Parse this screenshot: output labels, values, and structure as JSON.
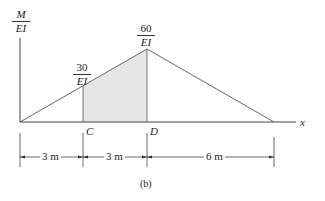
{
  "diagram": {
    "caption": "(b)",
    "y_axis_label": {
      "numerator": "M",
      "denominator": "EI"
    },
    "x_axis_label": "x",
    "peak_label": {
      "numerator": "60",
      "denominator": "EI"
    },
    "point_label": {
      "numerator": "30",
      "denominator": "EI"
    },
    "points": [
      {
        "name": "C",
        "label": "C"
      },
      {
        "name": "D",
        "label": "D"
      }
    ],
    "dimensions": [
      {
        "label": "3 m"
      },
      {
        "label": "3 m"
      },
      {
        "label": "6 m"
      }
    ],
    "shaded_region": {
      "from": "C",
      "to": "D",
      "fill": "#e6e6e6"
    },
    "colors": {
      "line": "#444444",
      "shade": "#e6e6e6"
    }
  }
}
